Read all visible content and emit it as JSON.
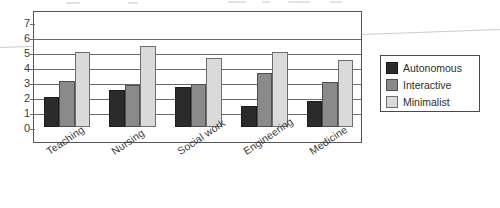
{
  "chart_data": {
    "type": "bar",
    "title": "",
    "subtitle": "",
    "xlabel": "",
    "ylabel": "",
    "categories": [
      "Teaching",
      "Nursing",
      "Social work",
      "Engineering",
      "Medicine"
    ],
    "series": [
      {
        "name": "Autonomous",
        "color": "#2b2b2b",
        "values": [
          2.0,
          2.5,
          2.7,
          1.4,
          1.75
        ]
      },
      {
        "name": "Interactive",
        "color": "#8a8a8a",
        "values": [
          3.1,
          2.8,
          2.9,
          3.6,
          3.0
        ]
      },
      {
        "name": "Minimalist",
        "color": "#dadada",
        "values": [
          5.0,
          5.4,
          4.6,
          5.0,
          4.5
        ]
      }
    ],
    "ylim": [
      0,
      7
    ],
    "ytick_labels": [
      "7",
      "6",
      "5",
      "4",
      "3",
      "2",
      "1",
      "0"
    ],
    "ytick_values": [
      7,
      6,
      5,
      4,
      3,
      2,
      1,
      0
    ],
    "grid": true,
    "grid_axis": "y",
    "legend_position": "right-outside",
    "bar_orientation": "vertical",
    "xtick_label_rotation": -34
  },
  "legend": {
    "entries": [
      {
        "label": "Autonomous"
      },
      {
        "label": "Interactive"
      },
      {
        "label": "Minimalist"
      }
    ]
  },
  "colors": {
    "autonomous": "#2b2b2b",
    "interactive": "#8a8a8a",
    "minimalist": "#dadada",
    "axis": "#555555",
    "grid": "#6b6b6b",
    "background": "#ffffff"
  }
}
